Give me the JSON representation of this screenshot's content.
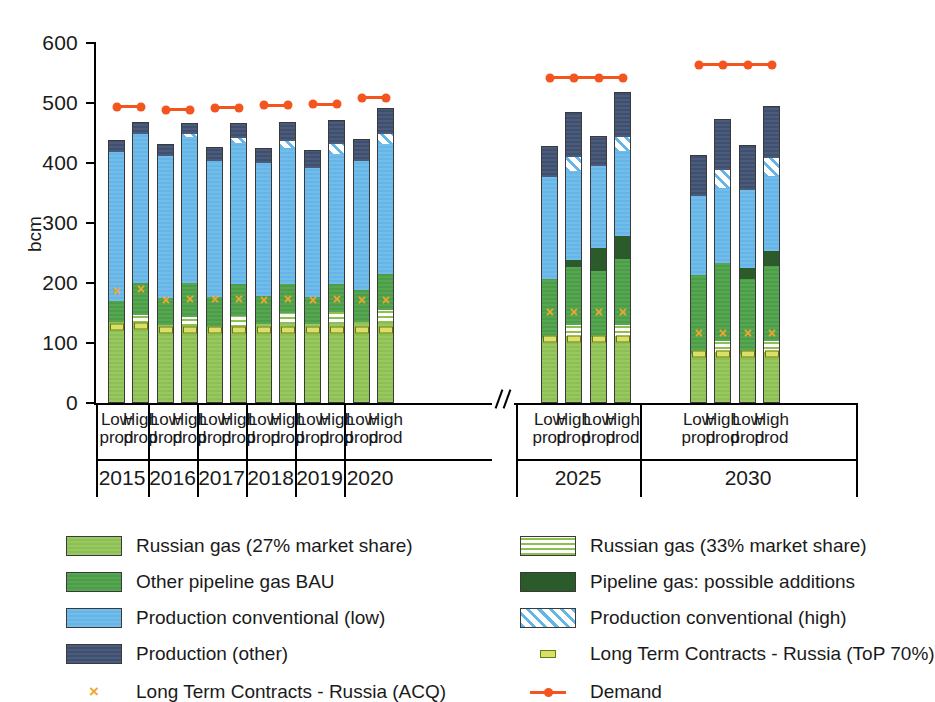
{
  "axis": {
    "ylabel": "bcm",
    "yticks": [
      0,
      100,
      200,
      300,
      400,
      500,
      600
    ],
    "ylim": [
      0,
      600
    ],
    "break_marker": "//"
  },
  "groups": [
    {
      "year": "2015",
      "scenarios": [
        "Low\nprod",
        "High\nprod"
      ]
    },
    {
      "year": "2016",
      "scenarios": [
        "Low\nprod",
        "High\nprod"
      ]
    },
    {
      "year": "2017",
      "scenarios": [
        "Low\nprod",
        "High\nprod"
      ]
    },
    {
      "year": "2018",
      "scenarios": [
        "Low\nprod",
        "High\nprod"
      ]
    },
    {
      "year": "2019",
      "scenarios": [
        "Low\nprod",
        "High\nprod"
      ]
    },
    {
      "year": "2020",
      "scenarios": [
        "Low\nprod",
        "High\nprod"
      ]
    },
    {
      "year": "2025",
      "scenarios": [
        "Low\nprod",
        "High\nprod",
        "Low\nprod",
        "High\nprod"
      ]
    },
    {
      "year": "2030",
      "scenarios": [
        "Low\nprod",
        "High\nprod",
        "Low\nprod",
        "High\nprod"
      ]
    }
  ],
  "scenario_label_line1": "Low",
  "scenario_label_line2": "High",
  "scenario_label_sub": "prod",
  "legend": [
    {
      "key": "rus27",
      "label": "Russian gas (27% market share)",
      "color": "#8cc152",
      "style": "solid"
    },
    {
      "key": "rus33",
      "label": "Russian gas (33% market share)",
      "color": "#8cc152",
      "style": "hlines"
    },
    {
      "key": "pipebau",
      "label": "Other pipeline gas BAU",
      "color": "#4a9e45",
      "style": "solid"
    },
    {
      "key": "pipeadd",
      "label": "Pipeline gas: possible additions",
      "color": "#2b5b2b",
      "style": "solid"
    },
    {
      "key": "prodlow",
      "label": "Production conventional (low)",
      "color": "#64b5e8",
      "style": "solid"
    },
    {
      "key": "prodhigh",
      "label": "Production conventional (high)",
      "color": "#64b5e8",
      "style": "diag"
    },
    {
      "key": "prodother",
      "label": "Production (other)",
      "color": "#3e4f70",
      "style": "solid"
    },
    {
      "key": "top70",
      "label": "Long Term Contracts - Russia (ToP 70%)",
      "color": "#d8e06a",
      "style": "marker-dash"
    },
    {
      "key": "acq",
      "label": "Long Term Contracts - Russia (ACQ)",
      "color": "#f0a72c",
      "style": "marker-x"
    },
    {
      "key": "demand",
      "label": "Demand",
      "color": "#f4541d",
      "style": "line-dot"
    }
  ],
  "chart_data": {
    "type": "bar",
    "subtype": "stacked",
    "title": "",
    "xlabel": "",
    "ylabel": "bcm",
    "ylim": [
      0,
      600
    ],
    "yticks": [
      0,
      100,
      200,
      300,
      400,
      500,
      600
    ],
    "grid": false,
    "legend_position": "below",
    "axis_break_after_category_index": 11,
    "categories": [
      "2015 Low prod",
      "2015 High prod",
      "2016 Low prod",
      "2016 High prod",
      "2017 Low prod",
      "2017 High prod",
      "2018 Low prod",
      "2018 High prod",
      "2019 Low prod",
      "2019 High prod",
      "2020 Low prod",
      "2020 High prod",
      "2025 Low prod",
      "2025 High prod",
      "2025 Low prod",
      "2025 High prod",
      "2030 Low prod",
      "2030 High prod",
      "2030 Low prod",
      "2030 High prod"
    ],
    "series": [
      {
        "name": "Russian gas (27% market share)",
        "values": [
          135,
          133,
          130,
          128,
          127,
          127,
          132,
          132,
          132,
          132,
          135,
          133,
          109,
          108,
          110,
          108,
          82,
          81,
          82,
          81
        ]
      },
      {
        "name": "Russian gas (33% market share)",
        "values": [
          0,
          14,
          0,
          16,
          0,
          18,
          0,
          18,
          0,
          20,
          0,
          22,
          0,
          22,
          0,
          22,
          0,
          22,
          0,
          22
        ]
      },
      {
        "name": "Other pipeline gas BAU",
        "values": [
          35,
          53,
          45,
          56,
          49,
          54,
          47,
          48,
          45,
          46,
          53,
          60,
          98,
          96,
          110,
          110,
          132,
          130,
          125,
          125
        ]
      },
      {
        "name": "Pipeline gas: possible additions",
        "values": [
          0,
          0,
          0,
          0,
          0,
          0,
          0,
          0,
          0,
          0,
          0,
          0,
          0,
          12,
          38,
          38,
          0,
          0,
          18,
          25
        ]
      },
      {
        "name": "Production conventional (low)",
        "values": [
          249,
          249,
          236,
          243,
          227,
          234,
          221,
          227,
          215,
          217,
          216,
          216,
          170,
          148,
          137,
          142,
          131,
          126,
          130,
          126
        ]
      },
      {
        "name": "Production conventional (high)",
        "values": [
          0,
          0,
          0,
          5,
          0,
          8,
          0,
          11,
          0,
          16,
          0,
          18,
          0,
          24,
          0,
          24,
          0,
          29,
          0,
          29
        ]
      },
      {
        "name": "Production (other)",
        "values": [
          19,
          19,
          21,
          18,
          24,
          25,
          25,
          32,
          29,
          41,
          36,
          42,
          51,
          75,
          50,
          75,
          68,
          85,
          75,
          87
        ]
      }
    ],
    "overlay_markers": [
      {
        "name": "Long Term Contracts - Russia (ToP 70%)",
        "symbol": "dash",
        "color": "#d8e06a",
        "values": [
          127,
          128,
          121,
          122,
          121,
          121,
          121,
          121,
          121,
          121,
          121,
          121,
          107,
          107,
          107,
          107,
          82,
          82,
          82,
          82
        ]
      },
      {
        "name": "Long Term Contracts - Russia (ACQ)",
        "symbol": "x",
        "color": "#f0a72c",
        "values": [
          187,
          190,
          172,
          173,
          173,
          174,
          171,
          173,
          171,
          173,
          171,
          172,
          152,
          152,
          152,
          152,
          117,
          117,
          117,
          117
        ]
      }
    ],
    "demand_line": {
      "name": "Demand",
      "color": "#f4541d",
      "segments": [
        {
          "group": "2015",
          "values": [
            494,
            494
          ]
        },
        {
          "group": "2016",
          "values": [
            489,
            489
          ]
        },
        {
          "group": "2017",
          "values": [
            492,
            492
          ]
        },
        {
          "group": "2018",
          "values": [
            496,
            496
          ]
        },
        {
          "group": "2019",
          "values": [
            498,
            498
          ]
        },
        {
          "group": "2020",
          "values": [
            509,
            509
          ]
        },
        {
          "group": "2025",
          "values": [
            542,
            542,
            542,
            542
          ]
        },
        {
          "group": "2030",
          "values": [
            564,
            564,
            564,
            564
          ]
        }
      ]
    }
  }
}
